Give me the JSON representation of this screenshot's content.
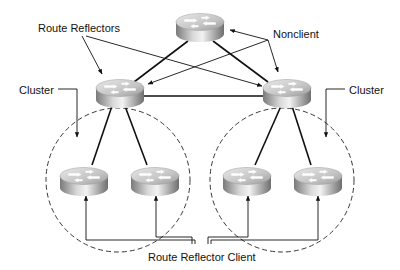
{
  "diagram": {
    "type": "bgp-route-reflector-topology",
    "labels": {
      "route_reflectors": "Route Reflectors",
      "nonclient": "Nonclient",
      "cluster_left": "Cluster",
      "cluster_right": "Cluster",
      "route_reflector_client": "Route Reflector Client"
    },
    "nodes": [
      {
        "id": "nonclient",
        "role": "Nonclient",
        "icon": "router-icon"
      },
      {
        "id": "rr-left",
        "role": "Route Reflector",
        "icon": "router-icon"
      },
      {
        "id": "rr-right",
        "role": "Route Reflector",
        "icon": "router-icon"
      },
      {
        "id": "client-1",
        "role": "Route Reflector Client",
        "icon": "router-icon"
      },
      {
        "id": "client-2",
        "role": "Route Reflector Client",
        "icon": "router-icon"
      },
      {
        "id": "client-3",
        "role": "Route Reflector Client",
        "icon": "router-icon"
      },
      {
        "id": "client-4",
        "role": "Route Reflector Client",
        "icon": "router-icon"
      }
    ],
    "links": [
      [
        "nonclient",
        "rr-left"
      ],
      [
        "nonclient",
        "rr-right"
      ],
      [
        "rr-left",
        "rr-right"
      ],
      [
        "rr-left",
        "client-1"
      ],
      [
        "rr-left",
        "client-2"
      ],
      [
        "rr-right",
        "client-3"
      ],
      [
        "rr-right",
        "client-4"
      ]
    ],
    "clusters": [
      {
        "name": "Cluster",
        "members": [
          "rr-left",
          "client-1",
          "client-2"
        ]
      },
      {
        "name": "Cluster",
        "members": [
          "rr-right",
          "client-3",
          "client-4"
        ]
      }
    ],
    "colors": {
      "line": "#111111",
      "router_light": "#e6e6e6",
      "router_dark": "#8a8a8a",
      "background": "#ffffff"
    }
  }
}
